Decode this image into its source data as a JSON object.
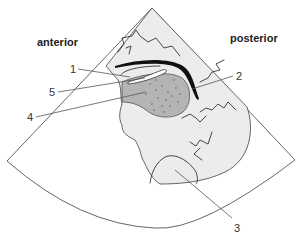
{
  "figure": {
    "type": "ultrasound-sector-schematic",
    "orientation_labels": {
      "left": "anterior",
      "right": "posterior"
    },
    "callouts": [
      {
        "number": "1",
        "target": "thin bright membrane over lesion"
      },
      {
        "number": "2",
        "target": "thick dark curved wall"
      },
      {
        "number": "3",
        "target": "lower tissue region"
      },
      {
        "number": "4",
        "target": "dotted hypoechoic lesion"
      },
      {
        "number": "5",
        "target": "bright echogenic rim"
      }
    ],
    "colors": {
      "background": "#ffffff",
      "tissue": "#ececec",
      "lesion": "#b4b4b4",
      "outline": "#555555",
      "wall": "#111111"
    }
  }
}
